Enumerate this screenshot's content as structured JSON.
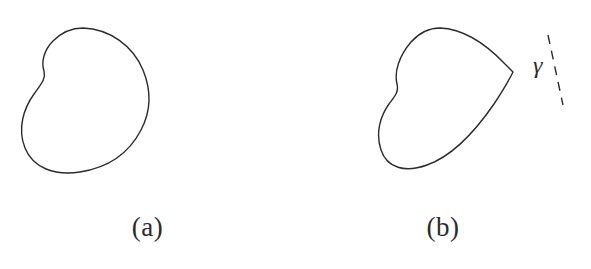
{
  "figure": {
    "width": 591,
    "height": 269,
    "background_color": "#ffffff",
    "ink_color": "#2b2b2b",
    "stroke_width": 1.4
  },
  "panels": [
    {
      "id": "a",
      "caption": "(a)",
      "description": "closed convex-like curve without marked boundary point"
    },
    {
      "id": "b",
      "caption": "(b)",
      "description": "same closed curve rotated, with dashed line crossing a corner point",
      "annotation_label": "γ"
    }
  ],
  "chart_data": {
    "type": "line",
    "title": "",
    "xlabel": "",
    "ylabel": "",
    "grid": false,
    "legend": "none",
    "xlim": [
      0,
      591
    ],
    "ylim": [
      0,
      269
    ],
    "series": [
      {
        "name": "shape-a-outline",
        "closed": true,
        "path": "M 83 28 C 110 29 133 46 143 70 C 152 92 150 113 141 130 C 128 155 106 168 80 172 C 55 176 33 168 25 148 C 17 128 24 108 34 94 C 41 84 46 79 44 71 C 41 62 44 50 53 41 C 62 32 72 28 83 28 Z"
      },
      {
        "name": "shape-b-outline",
        "closed": true,
        "path": "M 440 28 C 463 29 486 44 505 64 C 511 70 513 72 513 72 C 513 72 506 86 494 104 C 474 133 450 157 427 165 C 405 173 387 168 381 150 C 375 132 381 115 389 104 C 395 96 399 92 397 84 C 394 72 399 56 411 42 C 420 32 430 28 440 28 Z"
      },
      {
        "name": "gamma-dashed-line",
        "closed": false,
        "dashed": true,
        "path": "M 548 35 L 563 105"
      }
    ]
  }
}
